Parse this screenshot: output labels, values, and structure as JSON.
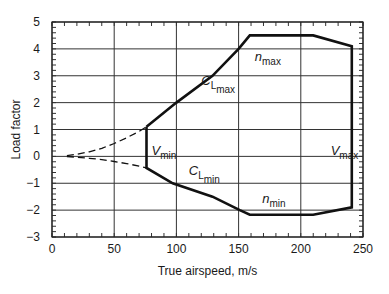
{
  "chart_data": {
    "type": "line",
    "title": "",
    "xlabel": "True airspeed, m/s",
    "ylabel": "Load factor",
    "xlim": [
      0,
      250
    ],
    "ylim": [
      -3,
      5
    ],
    "xticks": [
      0,
      50,
      100,
      150,
      200,
      250
    ],
    "xtick_labels": [
      "0",
      "50",
      "100",
      "150",
      "200",
      "250"
    ],
    "yticks": [
      -3,
      -2,
      -1,
      0,
      1,
      2,
      3,
      4,
      5
    ],
    "ytick_labels": [
      "−3",
      "−2",
      "−1",
      "0",
      "1",
      "2",
      "3",
      "4",
      "5"
    ],
    "x_minor_step": 10,
    "y_minor_step": 0.2,
    "grid": true,
    "legend": "none",
    "series": [
      {
        "name": "positive stall (dashed)",
        "style": "dashed",
        "x": [
          12,
          20,
          30,
          40,
          50,
          60,
          70,
          76
        ],
        "y": [
          0.03,
          0.08,
          0.17,
          0.3,
          0.48,
          0.69,
          0.93,
          1.1
        ]
      },
      {
        "name": "negative stall (dashed)",
        "style": "dashed",
        "x": [
          12,
          20,
          30,
          40,
          50,
          60,
          70,
          76
        ],
        "y": [
          -0.01,
          -0.03,
          -0.07,
          -0.12,
          -0.19,
          -0.27,
          -0.36,
          -0.43
        ]
      },
      {
        "name": "envelope",
        "style": "solid-bold",
        "x": [
          76,
          100,
          129,
          150,
          159,
          210,
          241,
          241,
          210,
          159,
          151,
          129,
          97,
          76,
          76
        ],
        "y": [
          1.1,
          2.0,
          3.0,
          4.0,
          4.5,
          4.5,
          4.1,
          -1.9,
          -2.17,
          -2.17,
          -2.0,
          -1.5,
          -1.0,
          -0.43,
          1.1
        ]
      }
    ],
    "annotations": [
      {
        "main": "C",
        "sub": "L",
        "subsub": "max",
        "x": 120,
        "y": 2.65
      },
      {
        "main": "n",
        "sub": "max",
        "x": 163,
        "y": 3.55
      },
      {
        "main": "V",
        "sub": "min",
        "x": 80,
        "y": 0.05
      },
      {
        "main": "V",
        "sub": "max",
        "x": 224,
        "y": 0.05
      },
      {
        "main": "C",
        "sub": "L",
        "subsub": "min",
        "x": 110,
        "y": -0.7
      },
      {
        "main": "n",
        "sub": "min",
        "x": 169,
        "y": -1.75
      }
    ]
  }
}
